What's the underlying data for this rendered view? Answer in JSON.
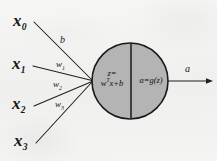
{
  "figure": {
    "type": "neuron-diagram",
    "background_color": "#f3f3f1",
    "ink_color": "#171717",
    "neuron_fill_color": "#b4b4b4",
    "neuron_stroke_color": "#1a1a1a"
  },
  "inputs": [
    {
      "id": "x0",
      "base": "x",
      "sub": "0"
    },
    {
      "id": "x1",
      "base": "x",
      "sub": "1"
    },
    {
      "id": "x2",
      "base": "x",
      "sub": "2"
    },
    {
      "id": "x3",
      "base": "x",
      "sub": "3"
    }
  ],
  "edges": [
    {
      "id": "edge-x0",
      "from": "x0",
      "label_base": "b",
      "label_sub": ""
    },
    {
      "id": "edge-x1",
      "from": "x1",
      "label_base": "w",
      "label_sub": "1"
    },
    {
      "id": "edge-x2",
      "from": "x2",
      "label_base": "w",
      "label_sub": "2"
    },
    {
      "id": "edge-x3",
      "from": "x3",
      "label_base": "w",
      "label_sub": "3"
    }
  ],
  "neuron": {
    "left_half": {
      "line1": "z=",
      "line2_pre": "w",
      "line2_sup": "T",
      "line2_post": "x+b",
      "formula": "z = w^T x + b"
    },
    "right_half": {
      "text": "a=g(z)",
      "formula": "a = g(z)"
    }
  },
  "output": {
    "label": "a"
  }
}
